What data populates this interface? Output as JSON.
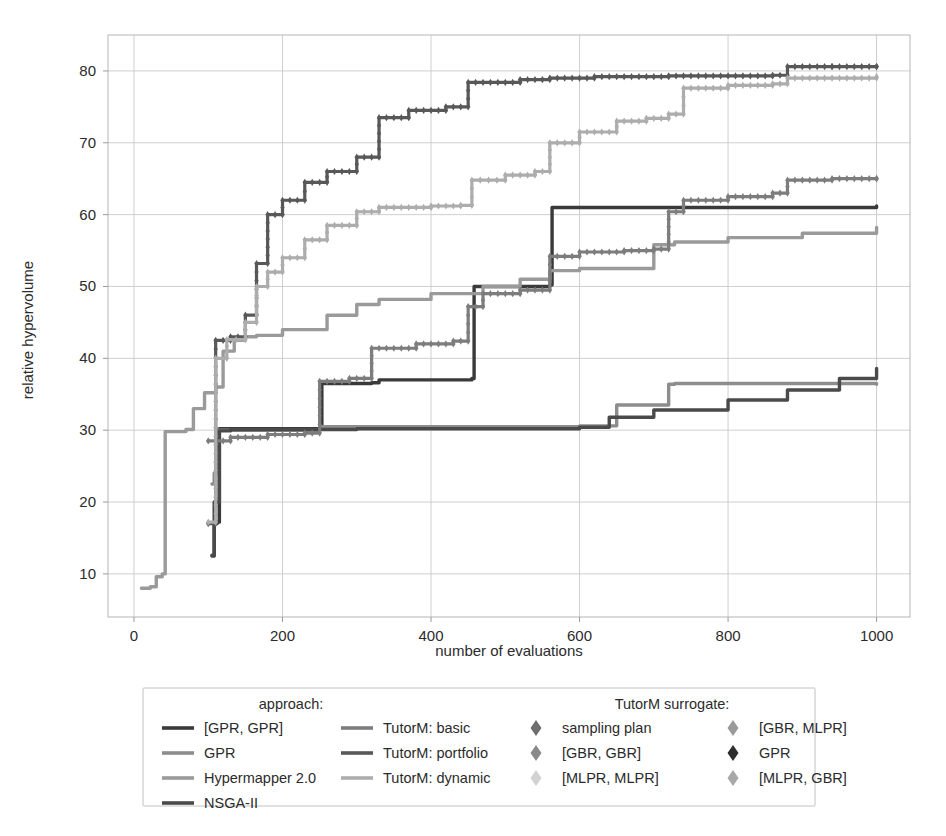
{
  "chart_data": {
    "type": "line",
    "title": "",
    "xlabel": "number of evaluations",
    "ylabel": "relative hypervolume",
    "xlim": [
      -35,
      1045
    ],
    "ylim": [
      4,
      85
    ],
    "xticks": [
      0,
      200,
      400,
      600,
      800,
      1000
    ],
    "yticks": [
      10,
      20,
      30,
      40,
      50,
      60,
      70,
      80
    ],
    "grid": true,
    "legend_position": "below",
    "series": [
      {
        "name": "[GPR, GPR]",
        "color": "#3a3a3a",
        "marker": "none",
        "points": [
          [
            105,
            12.5
          ],
          [
            108,
            17.0
          ],
          [
            112,
            17.2
          ],
          [
            115,
            30.2
          ],
          [
            250,
            30.3
          ],
          [
            253,
            36.5
          ],
          [
            320,
            36.6
          ],
          [
            330,
            37.0
          ],
          [
            455,
            37.2
          ],
          [
            458,
            50.0
          ],
          [
            560,
            50.2
          ],
          [
            563,
            61.0
          ],
          [
            1000,
            61.2
          ]
        ]
      },
      {
        "name": "GPR",
        "color": "#8d8d8d",
        "marker": "none",
        "points": [
          [
            105,
            22.5
          ],
          [
            108,
            24.0
          ],
          [
            112,
            30.0
          ],
          [
            250,
            30.3
          ],
          [
            253,
            30.5
          ],
          [
            600,
            30.6
          ],
          [
            650,
            33.5
          ],
          [
            720,
            36.4
          ],
          [
            728,
            36.5
          ],
          [
            1000,
            36.4
          ]
        ]
      },
      {
        "name": "Hypermapper 2.0",
        "color": "#9a9a9a",
        "marker": "none",
        "points": [
          [
            10,
            8.0
          ],
          [
            22,
            8.2
          ],
          [
            30,
            9.6
          ],
          [
            38,
            10.0
          ],
          [
            42,
            29.8
          ],
          [
            70,
            30.1
          ],
          [
            80,
            33.0
          ],
          [
            95,
            35.2
          ],
          [
            110,
            36.0
          ],
          [
            120,
            41.0
          ],
          [
            135,
            42.5
          ],
          [
            150,
            43.0
          ],
          [
            165,
            43.2
          ],
          [
            200,
            44.0
          ],
          [
            260,
            46.0
          ],
          [
            300,
            47.5
          ],
          [
            330,
            48.2
          ],
          [
            400,
            49.0
          ],
          [
            470,
            50.0
          ],
          [
            520,
            51.0
          ],
          [
            560,
            52.2
          ],
          [
            600,
            52.5
          ],
          [
            700,
            55.8
          ],
          [
            728,
            56.2
          ],
          [
            800,
            56.8
          ],
          [
            900,
            57.4
          ],
          [
            1000,
            58.2
          ]
        ]
      },
      {
        "name": "NSGA-II",
        "color": "#4a4a4a",
        "marker": "none",
        "points": [
          [
            105,
            12.6
          ],
          [
            108,
            20.0
          ],
          [
            115,
            29.9
          ],
          [
            130,
            30.1
          ],
          [
            300,
            30.2
          ],
          [
            420,
            30.2
          ],
          [
            600,
            30.4
          ],
          [
            640,
            31.8
          ],
          [
            700,
            32.8
          ],
          [
            800,
            34.2
          ],
          [
            880,
            35.6
          ],
          [
            950,
            37.2
          ],
          [
            1000,
            38.6
          ]
        ]
      },
      {
        "name": "TutorM: basic",
        "color": "#7d7d7d",
        "marker": "diamond",
        "points": [
          [
            100,
            28.5
          ],
          [
            130,
            29.0
          ],
          [
            180,
            29.4
          ],
          [
            230,
            29.6
          ],
          [
            250,
            36.8
          ],
          [
            290,
            37.2
          ],
          [
            320,
            41.4
          ],
          [
            380,
            42.0
          ],
          [
            430,
            42.4
          ],
          [
            450,
            47.2
          ],
          [
            470,
            49.0
          ],
          [
            520,
            49.5
          ],
          [
            560,
            54.2
          ],
          [
            600,
            54.8
          ],
          [
            660,
            55.0
          ],
          [
            700,
            55.2
          ],
          [
            720,
            60.4
          ],
          [
            740,
            62.0
          ],
          [
            800,
            62.5
          ],
          [
            860,
            63.0
          ],
          [
            880,
            64.8
          ],
          [
            940,
            65.0
          ],
          [
            1000,
            65.0
          ]
        ]
      },
      {
        "name": "TutorM: portfolio",
        "color": "#585858",
        "marker": "diamond",
        "points": [
          [
            100,
            17.0
          ],
          [
            110,
            42.5
          ],
          [
            130,
            43.0
          ],
          [
            150,
            46.0
          ],
          [
            165,
            53.2
          ],
          [
            180,
            60.0
          ],
          [
            200,
            62.0
          ],
          [
            230,
            64.5
          ],
          [
            260,
            66.0
          ],
          [
            300,
            68.0
          ],
          [
            330,
            73.5
          ],
          [
            370,
            74.5
          ],
          [
            420,
            75.0
          ],
          [
            450,
            78.4
          ],
          [
            520,
            78.8
          ],
          [
            560,
            79.0
          ],
          [
            620,
            79.2
          ],
          [
            720,
            79.3
          ],
          [
            860,
            79.4
          ],
          [
            880,
            80.6
          ],
          [
            940,
            80.6
          ],
          [
            1000,
            80.6
          ]
        ]
      },
      {
        "name": "TutorM: dynamic",
        "color": "#adadad",
        "marker": "diamond",
        "points": [
          [
            100,
            17.2
          ],
          [
            110,
            40.0
          ],
          [
            125,
            42.6
          ],
          [
            150,
            45.0
          ],
          [
            165,
            50.0
          ],
          [
            180,
            52.0
          ],
          [
            200,
            54.0
          ],
          [
            230,
            56.5
          ],
          [
            260,
            58.5
          ],
          [
            300,
            60.4
          ],
          [
            330,
            61.0
          ],
          [
            400,
            61.2
          ],
          [
            440,
            61.3
          ],
          [
            455,
            64.8
          ],
          [
            500,
            65.5
          ],
          [
            540,
            66.0
          ],
          [
            560,
            70.0
          ],
          [
            600,
            71.5
          ],
          [
            650,
            73.0
          ],
          [
            690,
            73.4
          ],
          [
            720,
            74.0
          ],
          [
            740,
            77.6
          ],
          [
            800,
            78.0
          ],
          [
            860,
            78.2
          ],
          [
            880,
            79.0
          ],
          [
            1000,
            79.2
          ]
        ]
      }
    ]
  },
  "legend": {
    "left_title": "approach:",
    "right_title": "TutorM surrogate:",
    "approach_col1": [
      {
        "label": "[GPR, GPR]",
        "color": "#3a3a3a"
      },
      {
        "label": "GPR",
        "color": "#8d8d8d"
      },
      {
        "label": "Hypermapper 2.0",
        "color": "#9a9a9a"
      },
      {
        "label": "NSGA-II",
        "color": "#4a4a4a"
      }
    ],
    "approach_col2": [
      {
        "label": "TutorM: basic",
        "color": "#7d7d7d"
      },
      {
        "label": "TutorM: portfolio",
        "color": "#585858"
      },
      {
        "label": "TutorM: dynamic",
        "color": "#adadad"
      }
    ],
    "surrogate_col1": [
      {
        "label": "sampling plan",
        "color": "#6f6f6f"
      },
      {
        "label": "[GBR, GBR]",
        "color": "#8a8a8a"
      },
      {
        "label": "[MLPR, MLPR]",
        "color": "#d2d2d2"
      }
    ],
    "surrogate_col2": [
      {
        "label": "[GBR, MLPR]",
        "color": "#9b9b9b"
      },
      {
        "label": "GPR",
        "color": "#2e2e2e"
      },
      {
        "label": "[MLPR, GBR]",
        "color": "#a8a8a8"
      }
    ]
  }
}
